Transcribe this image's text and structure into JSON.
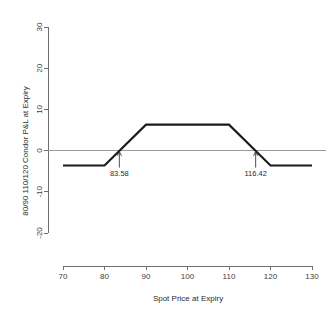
{
  "chart_data": {
    "type": "line",
    "title": "",
    "xlabel": "Spot Price at Expiry",
    "ylabel": "80/90 110/120 Condor P&L at Expiry",
    "xlim": [
      70,
      130
    ],
    "ylim": [
      -20,
      30
    ],
    "xticks": [
      70,
      80,
      90,
      100,
      110,
      120,
      130
    ],
    "yticks": [
      -20,
      -10,
      0,
      10,
      20,
      30
    ],
    "xtick_labels": [
      "70",
      "80",
      "90",
      "100",
      "110",
      "120",
      "130"
    ],
    "ytick_labels": [
      "-20",
      "-10",
      "0",
      "10",
      "20",
      "30"
    ],
    "grid": false,
    "legend": false,
    "zero_reference_line": 0,
    "series": [
      {
        "name": "80/90 110/120 Condor P&L at Expiry",
        "color": "#1a1a1a",
        "x": [
          70,
          80,
          90,
          110,
          120,
          130
        ],
        "values": [
          -3.6,
          -3.6,
          6.3,
          6.3,
          -3.6,
          -3.6
        ]
      }
    ],
    "annotations": [
      {
        "id": "lower-breakeven",
        "label": "83.58",
        "x": 83.58,
        "y": 0,
        "arrow": "up"
      },
      {
        "id": "upper-breakeven",
        "label": "116.42",
        "x": 116.42,
        "y": 0,
        "arrow": "up"
      }
    ],
    "colors": {
      "line": "#1a1a1a",
      "axis": "#6d6d6d",
      "zero_line": "#9a9a9a",
      "text": "#2b2b2b",
      "background": "#ffffff"
    }
  }
}
